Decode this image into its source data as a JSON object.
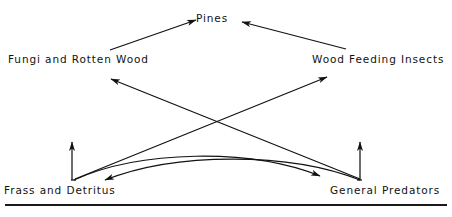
{
  "figure": {
    "type": "food-web-diagram",
    "background_color": "#ffffff",
    "ink_color": "#121212",
    "caption_rule_color": "#1a1a1a",
    "caption_partial_text": "",
    "nodes": [
      {
        "id": "pines",
        "label": "Pines",
        "x": 222,
        "y": 18
      },
      {
        "id": "fungi",
        "label": "Fungi and Rotten Wood",
        "x": 80,
        "y": 59
      },
      {
        "id": "insects",
        "label": "Wood Feeding Insects",
        "x": 380,
        "y": 59
      },
      {
        "id": "frass",
        "label": "Frass and Detritus",
        "x": 62,
        "y": 190
      },
      {
        "id": "predators",
        "label": "General Predators",
        "x": 390,
        "y": 190
      }
    ],
    "edges": [
      {
        "from": "fungi",
        "to": "pines",
        "shape": "straight",
        "arrow": "end"
      },
      {
        "from": "insects",
        "to": "pines",
        "shape": "straight",
        "arrow": "end"
      },
      {
        "from": "frass",
        "to": "insects",
        "shape": "straight",
        "arrow": "end"
      },
      {
        "from": "predators",
        "to": "fungi",
        "shape": "straight",
        "arrow": "end"
      },
      {
        "from": "frass",
        "to": "predators",
        "shape": "curved",
        "arrow": "end"
      },
      {
        "from": "predators",
        "to": "frass",
        "shape": "curved",
        "arrow": "end"
      },
      {
        "from": "frass",
        "to": "up",
        "shape": "vertical",
        "arrow": "end"
      },
      {
        "from": "predators",
        "to": "up",
        "shape": "vertical",
        "arrow": "end"
      }
    ]
  }
}
